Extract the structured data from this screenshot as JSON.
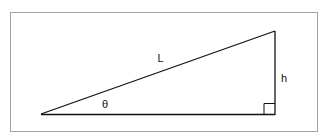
{
  "diagram": {
    "type": "right-triangle",
    "labels": {
      "hypotenuse": "L",
      "height": "h",
      "angle": "θ"
    },
    "frame": {
      "x": 10,
      "y": 12,
      "width": 308,
      "height": 120,
      "color": "#999999"
    },
    "vertices": {
      "left": [
        41,
        114
      ],
      "top": [
        275,
        31
      ],
      "right_angle": [
        275,
        114
      ]
    },
    "line_color": "#111111",
    "right_angle_marker_size": 11
  }
}
